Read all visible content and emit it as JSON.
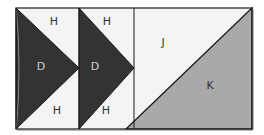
{
  "diagram": {
    "colors": {
      "background": "#f4f4f4",
      "dark": "#333333",
      "medium": "#a9a9a9",
      "outline": "#1a1a1a",
      "label_on_light": "#333333",
      "label_on_dark": "#d0d0d0"
    },
    "pieces": [
      {
        "id": "h1",
        "label": "H",
        "shape": "triangle",
        "fill": "light"
      },
      {
        "id": "d1",
        "label": "D",
        "shape": "triangle",
        "fill": "dark"
      },
      {
        "id": "h2",
        "label": "H",
        "shape": "triangle",
        "fill": "light"
      },
      {
        "id": "h3",
        "label": "H",
        "shape": "triangle",
        "fill": "light"
      },
      {
        "id": "d2",
        "label": "D",
        "shape": "triangle",
        "fill": "dark"
      },
      {
        "id": "h4",
        "label": "H",
        "shape": "triangle",
        "fill": "light"
      },
      {
        "id": "j",
        "label": "J",
        "shape": "triangle",
        "fill": "light"
      },
      {
        "id": "k",
        "label": "K",
        "shape": "triangle",
        "fill": "medium"
      }
    ]
  }
}
